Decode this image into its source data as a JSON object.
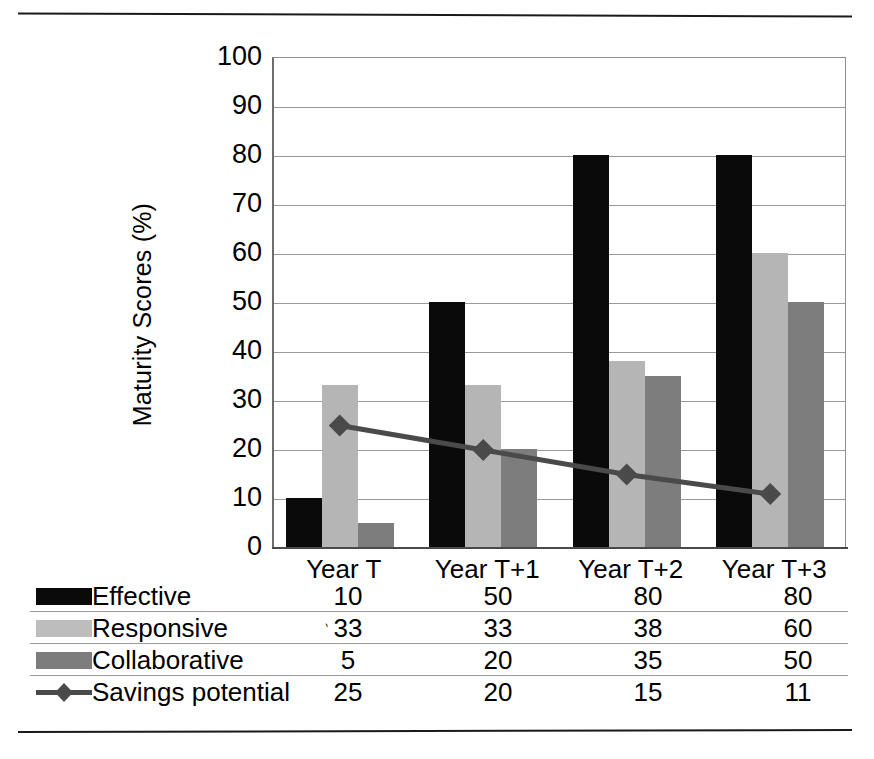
{
  "chart_data": {
    "type": "bar",
    "title": "",
    "xlabel": "",
    "ylabel": "Maturity  Scores (%)",
    "ylim": [
      0,
      100
    ],
    "ytick_step": 10,
    "yticks": [
      "100",
      "90",
      "80",
      "70",
      "60",
      "50",
      "40",
      "30",
      "20",
      "10",
      "0"
    ],
    "grid": true,
    "legend_position": "table-below",
    "categories": [
      "Year T",
      "Year T+1",
      "Year T+2",
      "Year T+3"
    ],
    "series": [
      {
        "name": "Effective",
        "type": "bar",
        "color": "#0a0a0a",
        "values": [
          10,
          50,
          80,
          80
        ]
      },
      {
        "name": "Responsive",
        "type": "bar",
        "color": "#b5b5b5",
        "values": [
          33,
          33,
          38,
          60
        ]
      },
      {
        "name": "Collaborative",
        "type": "bar",
        "color": "#7d7d7d",
        "values": [
          5,
          20,
          35,
          50
        ]
      },
      {
        "name": "Savings potential",
        "type": "line",
        "color": "#4a4a4a",
        "marker": "diamond",
        "values": [
          25,
          20,
          15,
          11
        ]
      }
    ]
  },
  "axis": {
    "y_label": "Maturity  Scores (%)",
    "y_ticks": [
      "100",
      "90",
      "80",
      "70",
      "60",
      "50",
      "40",
      "30",
      "20",
      "10",
      "0"
    ],
    "x_ticks": [
      "Year T",
      "Year T+1",
      "Year T+2",
      "Year T+3"
    ]
  },
  "table": {
    "columns": [
      "Year T",
      "Year T+1",
      "Year T+2",
      "Year T+3"
    ],
    "rows": [
      {
        "label": "Effective",
        "swatch": "black-bar-swatch",
        "values": [
          "10",
          "50",
          "80",
          "80"
        ]
      },
      {
        "label": "Responsive",
        "swatch": "light-gray-bar-swatch",
        "values": [
          "33",
          "33",
          "38",
          "60"
        ]
      },
      {
        "label": "Collaborative",
        "swatch": "medium-gray-bar-swatch",
        "values": [
          "5",
          "20",
          "35",
          "50"
        ]
      },
      {
        "label": "Savings potential",
        "swatch": "line-marker-swatch",
        "values": [
          "25",
          "20",
          "15",
          "11"
        ]
      }
    ],
    "stray_mark": "`"
  },
  "colors": {
    "effective": "#0a0a0a",
    "responsive": "#b5b5b5",
    "collaborative": "#7d7d7d",
    "savings_line": "#4a4a4a",
    "gridline": "#9a9a9a",
    "rule": "#1a1a1a"
  }
}
